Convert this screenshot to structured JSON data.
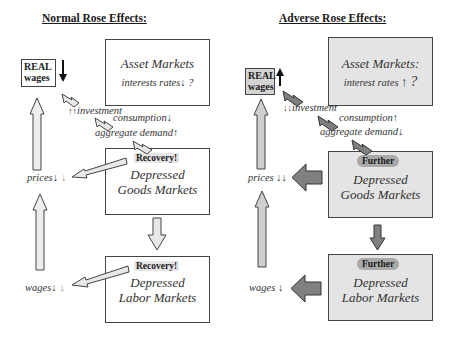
{
  "left": {
    "title": "Normal Rose Effects:",
    "real_wages": [
      "REAL",
      "wages"
    ],
    "asset_markets": {
      "title": "Asset Markets",
      "line": "interests rates",
      "qmark": "?"
    },
    "investment": "investment",
    "consumption": "consumption",
    "aggregate_demand": "aggregate demand",
    "goods_box": {
      "tag": "Recovery!",
      "line1": "Depressed",
      "line2": "Goods Markets"
    },
    "labor_box": {
      "tag": "Recovery!",
      "line1": "Depressed",
      "line2": "Labor Markets"
    },
    "prices": "prices",
    "wages": "wages"
  },
  "right": {
    "title": "Adverse Rose Effects:",
    "real_wages": [
      "REAL",
      "wages"
    ],
    "asset_markets": {
      "title": "Asset Markets:",
      "line": "interest rates",
      "qmark": "?"
    },
    "investment": "investment",
    "consumption": "consumption",
    "aggregate_demand": "aggregate demand",
    "goods_box": {
      "tag": "Further",
      "line1": "Depressed",
      "line2": "Goods Markets"
    },
    "labor_box": {
      "tag": "Further",
      "line1": "Depressed",
      "line2": "Labor Markets"
    },
    "prices": "prices",
    "wages": "wages"
  },
  "colors": {
    "plain_box": "#ffffff",
    "shaded_box": "#e4e4e4",
    "light_arrow": "#e8e8e8",
    "dark_arrow": "#808080",
    "further_badge": "#a9a9a9"
  }
}
